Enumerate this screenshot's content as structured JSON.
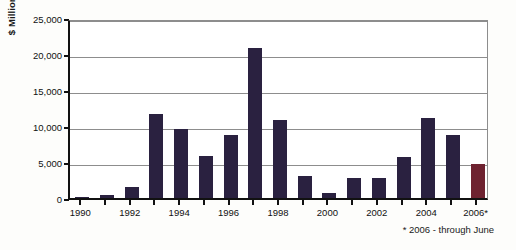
{
  "chart_data": {
    "type": "bar",
    "title": "",
    "xlabel": "",
    "ylabel": "$ Millions",
    "ylim": [
      0,
      25000
    ],
    "ytick_values": [
      0,
      5000,
      10000,
      15000,
      20000,
      25000
    ],
    "ytick_labels": [
      "0",
      "5,000",
      "10,000",
      "15,000",
      "20,000",
      "25,000"
    ],
    "grid": true,
    "legend": "none",
    "categories": [
      "1990",
      "1991",
      "1992",
      "1993",
      "1994",
      "1995",
      "1996",
      "1997",
      "1998",
      "1999",
      "2000",
      "2001",
      "2002",
      "2003",
      "2004",
      "2005",
      "2006*"
    ],
    "xtick_labels_shown": [
      "1990",
      "1992",
      "1994",
      "1996",
      "1998",
      "2000",
      "2002",
      "2004",
      "2006*"
    ],
    "values": [
      200,
      400,
      1500,
      11700,
      9600,
      5900,
      8700,
      20800,
      10900,
      3100,
      700,
      2800,
      2800,
      5700,
      11100,
      8700,
      4700
    ],
    "bar_colors": [
      "#2a2140",
      "#2a2140",
      "#2a2140",
      "#2a2140",
      "#2a2140",
      "#2a2140",
      "#2a2140",
      "#2a2140",
      "#2a2140",
      "#2a2140",
      "#2a2140",
      "#2a2140",
      "#2a2140",
      "#2a2140",
      "#2a2140",
      "#2a2140",
      "#6e2230"
    ],
    "series_color": "#2a2140",
    "highlight_color": "#6e2230",
    "annotation": "* 2006 - through June"
  }
}
